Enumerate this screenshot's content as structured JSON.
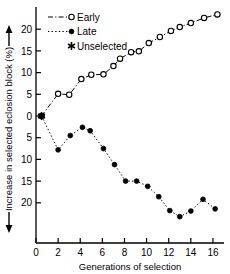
{
  "chart_data": {
    "type": "line",
    "title": "",
    "xlabel": "Generations of selection",
    "ylabel": "Increase in selected eclosion block (%)",
    "ylabel_arrows": "both",
    "xlim": [
      0,
      17
    ],
    "ylim": [
      -23.5,
      24
    ],
    "grid": false,
    "legend_position": "top-left",
    "xticks": [
      0,
      2,
      4,
      6,
      8,
      10,
      12,
      14,
      16
    ],
    "xtick_labels": [
      "0",
      "2",
      "4",
      "6",
      "8",
      "10",
      "12",
      "14",
      "16"
    ],
    "yticks": [
      20,
      15,
      10,
      5,
      0,
      -5,
      -10,
      -15,
      -20
    ],
    "ytick_labels": [
      "20",
      "15",
      "10",
      "5",
      "0",
      "5",
      "10",
      "15",
      "20"
    ],
    "series": [
      {
        "name": "Early",
        "marker": "open-circle",
        "linestyle": "dash-dot",
        "color": "#000000",
        "points": [
          {
            "x": 0.5,
            "y": 0.0
          },
          {
            "x": 2.0,
            "y": 5.1
          },
          {
            "x": 3.0,
            "y": 4.9
          },
          {
            "x": 4.1,
            "y": 8.5
          },
          {
            "x": 5.0,
            "y": 9.5
          },
          {
            "x": 6.1,
            "y": 9.6
          },
          {
            "x": 7.0,
            "y": 11.5
          },
          {
            "x": 7.6,
            "y": 13.2
          },
          {
            "x": 8.6,
            "y": 14.7
          },
          {
            "x": 9.3,
            "y": 14.9
          },
          {
            "x": 10.2,
            "y": 16.8
          },
          {
            "x": 11.2,
            "y": 18.2
          },
          {
            "x": 12.2,
            "y": 19.6
          },
          {
            "x": 13.0,
            "y": 20.5
          },
          {
            "x": 14.0,
            "y": 21.4
          },
          {
            "x": 15.2,
            "y": 22.6
          },
          {
            "x": 16.4,
            "y": 23.4
          }
        ]
      },
      {
        "name": "Late",
        "marker": "filled-circle",
        "linestyle": "dotted",
        "color": "#000000",
        "points": [
          {
            "x": 0.5,
            "y": 0.0
          },
          {
            "x": 2.0,
            "y": -7.8
          },
          {
            "x": 3.1,
            "y": -4.5
          },
          {
            "x": 4.2,
            "y": -2.6
          },
          {
            "x": 4.9,
            "y": -3.4
          },
          {
            "x": 6.1,
            "y": -7.5
          },
          {
            "x": 7.1,
            "y": -11.2
          },
          {
            "x": 8.1,
            "y": -15.0
          },
          {
            "x": 9.1,
            "y": -15.0
          },
          {
            "x": 10.1,
            "y": -16.2
          },
          {
            "x": 11.1,
            "y": -18.6
          },
          {
            "x": 12.1,
            "y": -21.8
          },
          {
            "x": 13.0,
            "y": -23.2
          },
          {
            "x": 14.0,
            "y": -21.9
          },
          {
            "x": 15.1,
            "y": -19.2
          },
          {
            "x": 16.2,
            "y": -21.4
          }
        ]
      },
      {
        "name": "Unselected",
        "marker": "asterisk",
        "linestyle": "none",
        "color": "#000000",
        "points": [
          {
            "x": 0.5,
            "y": 0.0
          }
        ]
      }
    ],
    "legend": [
      {
        "label": "Early",
        "marker": "open-circle",
        "linestyle": "dash-dot"
      },
      {
        "label": "Late",
        "marker": "filled-circle",
        "linestyle": "dotted"
      },
      {
        "label": "Unselected",
        "marker": "asterisk",
        "linestyle": "none"
      }
    ]
  }
}
